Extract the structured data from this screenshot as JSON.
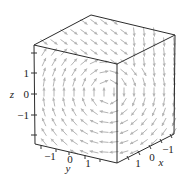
{
  "chart_data": {
    "type": "3d-vector-field",
    "title": "",
    "axes": {
      "x": {
        "label": "x",
        "ticks": [
          "-1",
          "0",
          "1"
        ],
        "range": [
          -2,
          2
        ]
      },
      "y": {
        "label": "y",
        "ticks": [
          "-1",
          "0",
          "1"
        ],
        "range": [
          -2,
          2
        ]
      },
      "z": {
        "label": "z",
        "ticks": [
          "-1",
          "0",
          "1"
        ],
        "range": [
          -2,
          2
        ]
      }
    },
    "box": true,
    "arrow_color": "#b4b4b4",
    "edge_color": "#2b2b2b"
  },
  "labels": {
    "z_axis": "z",
    "y_axis": "y",
    "x_axis": "x",
    "z_ticks": [
      "1",
      "0",
      "−1"
    ],
    "y_ticks": [
      "−1",
      "0",
      "1"
    ],
    "x_ticks": [
      "1",
      "0",
      "−1"
    ]
  }
}
